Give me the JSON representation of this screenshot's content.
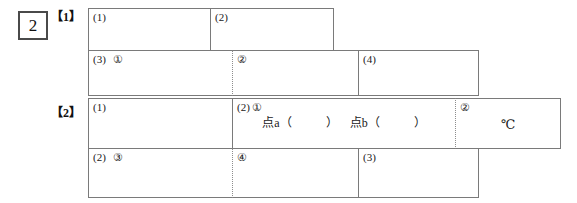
{
  "sheet": {
    "question_number": "2",
    "sections": [
      {
        "label": "【1】"
      },
      {
        "label": "【2】"
      }
    ],
    "rows": [
      {
        "name": "row-1",
        "cells": [
          {
            "name": "answer-cell-1-1",
            "tag": "(1)",
            "sub": "",
            "body": "",
            "unit": ""
          },
          {
            "name": "answer-cell-1-2",
            "tag": "(2)",
            "sub": "",
            "body": "",
            "unit": ""
          }
        ]
      },
      {
        "name": "row-2",
        "cells": [
          {
            "name": "answer-cell-2-1",
            "tag": "(3)",
            "sub": "①",
            "body": "",
            "unit": ""
          },
          {
            "name": "answer-cell-2-2",
            "tag": "",
            "sub": "②",
            "body": "",
            "unit": ""
          },
          {
            "name": "answer-cell-2-3",
            "tag": "(4)",
            "sub": "",
            "body": "",
            "unit": ""
          }
        ]
      },
      {
        "name": "row-3",
        "cells": [
          {
            "name": "answer-cell-3-1",
            "tag": "(1)",
            "sub": "",
            "body": "",
            "unit": ""
          },
          {
            "name": "answer-cell-3-2",
            "tag": "(2)",
            "sub": "①",
            "body_a": "点a（",
            "body_b": "）",
            "body_c": "点b（",
            "body_d": "）",
            "unit": ""
          },
          {
            "name": "answer-cell-3-3",
            "tag": "",
            "sub": "②",
            "body": "",
            "unit": "℃"
          }
        ]
      },
      {
        "name": "row-4",
        "cells": [
          {
            "name": "answer-cell-4-1",
            "tag": "(2)",
            "sub": "③",
            "body": "",
            "unit": ""
          },
          {
            "name": "answer-cell-4-2",
            "tag": "",
            "sub": "④",
            "body": "",
            "unit": ""
          },
          {
            "name": "answer-cell-4-3",
            "tag": "(3)",
            "sub": "",
            "body": "",
            "unit": ""
          }
        ]
      }
    ]
  }
}
